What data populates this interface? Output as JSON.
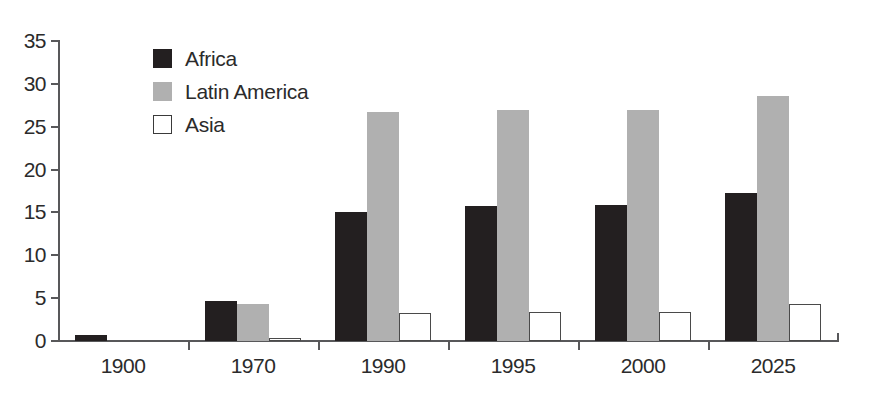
{
  "chart_data": {
    "type": "bar",
    "title": "",
    "subtitle": "",
    "xlabel": "",
    "ylabel": "",
    "categories": [
      "1900",
      "1970",
      "1990",
      "1995",
      "2000",
      "2025"
    ],
    "series": [
      {
        "name": "Africa",
        "color": "#231f20",
        "values": [
          0.7,
          4.7,
          15.0,
          15.8,
          15.9,
          17.3
        ]
      },
      {
        "name": "Latin America",
        "color": "#b0b0b0",
        "values": [
          0.0,
          4.3,
          26.7,
          26.9,
          26.9,
          28.6
        ]
      },
      {
        "name": "Asia",
        "color": "#ffffff",
        "values": [
          0.0,
          0.3,
          3.3,
          3.4,
          3.4,
          4.3
        ]
      }
    ],
    "ylim": [
      0,
      35
    ],
    "yticks": [
      0,
      5,
      10,
      15,
      20,
      25,
      30,
      35
    ],
    "ytick_labels": [
      "0",
      "5",
      "10",
      "15",
      "20",
      "25",
      "30",
      "35"
    ],
    "grid": false,
    "legend_position": "top-left",
    "legend": [
      {
        "label": "Africa",
        "swatch": "filled-black"
      },
      {
        "label": "Latin America",
        "swatch": "filled-gray"
      },
      {
        "label": "Asia",
        "swatch": "outlined-white"
      }
    ],
    "axis_color": "#58585a",
    "background": "#ffffff"
  }
}
